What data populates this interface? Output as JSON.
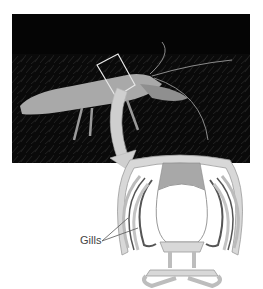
{
  "figure": {
    "photo": {
      "subject": "crayfish",
      "highlight": "carapace-cross-section-box"
    },
    "diagram": {
      "title": "crayfish-cross-section",
      "labels": [
        {
          "text": "Gills"
        }
      ],
      "colors": {
        "shell": "#d4d4d4",
        "shell_outline": "#9a9a9a",
        "gills_dark": "#555555",
        "heart_chamber": "#a6a6a6",
        "arrow": "#c8c8c8"
      }
    }
  }
}
